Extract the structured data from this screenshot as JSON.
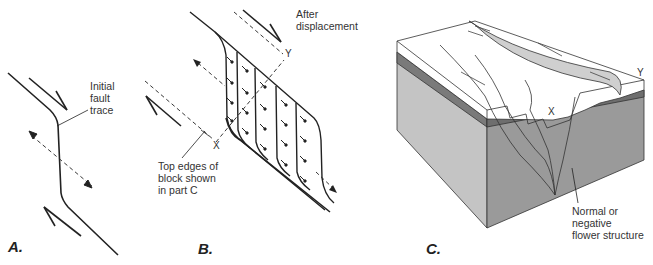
{
  "panels": {
    "a": {
      "label": "A.",
      "annotation": "Initial\nfault\ntrace"
    },
    "b": {
      "label": "B.",
      "annotation_top": "After\ndisplacement",
      "annotation_bottom": "Top edges of\nblock shown\nin part C",
      "marker_x": "X",
      "marker_y": "Y"
    },
    "c": {
      "label": "C.",
      "annotation": "Normal or\nnegative\nflower structure",
      "marker_x": "X",
      "marker_y": "Y"
    }
  },
  "colors": {
    "line": "#222222",
    "top_surface": "#ffffff",
    "dark_layer": "#7a7a7a",
    "front_face": "#c4c4c4",
    "side_face": "#9a9a9a",
    "pull_apart_strip": "#cfcfcf"
  }
}
